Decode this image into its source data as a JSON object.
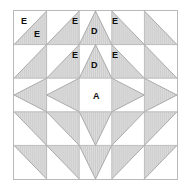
{
  "diagram": {
    "grid": {
      "columns": 5,
      "rows": 5
    },
    "colors": {
      "fabric_shaded": "#d3d3d3",
      "fabric_background": "#ffffff",
      "seam_line": "#9a9a9a",
      "outer_border": "#b9b9b9",
      "label_text": "#0d0d0d"
    },
    "labels": [
      {
        "id": "e-top-left-outer",
        "text": "E",
        "x": 7,
        "y": 6
      },
      {
        "id": "e-top-left-inner",
        "text": "E",
        "x": 20,
        "y": 19
      },
      {
        "id": "e-top-mid-left",
        "text": "E",
        "x": 58,
        "y": 6
      },
      {
        "id": "d-top",
        "text": "D",
        "x": 77,
        "y": 16
      },
      {
        "id": "e-top-mid-right",
        "text": "E",
        "x": 98,
        "y": 6
      },
      {
        "id": "e-row2-left",
        "text": "E",
        "x": 58,
        "y": 40
      },
      {
        "id": "d-row2",
        "text": "D",
        "x": 77,
        "y": 50
      },
      {
        "id": "e-row2-right",
        "text": "E",
        "x": 98,
        "y": 40
      },
      {
        "id": "a-center",
        "text": "A",
        "x": 79,
        "y": 81
      }
    ],
    "pieces": {
      "center_square_label": "A",
      "flying_geese_label": "D",
      "half_square_triangle_label": "E"
    }
  }
}
